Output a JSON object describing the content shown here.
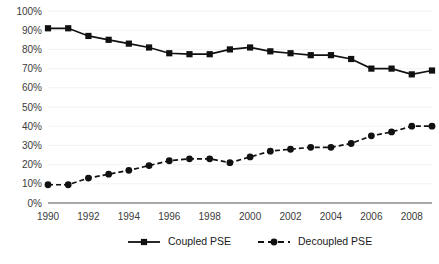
{
  "chart_data": {
    "type": "line",
    "title": "",
    "subtitle": "",
    "xlabel": "",
    "ylabel": "",
    "x": [
      1990,
      1991,
      1992,
      1993,
      1994,
      1995,
      1996,
      1997,
      1998,
      1999,
      2000,
      2001,
      2002,
      2003,
      2004,
      2005,
      2006,
      2007,
      2008,
      2009
    ],
    "categories": [
      "1990",
      "1991",
      "1992",
      "1993",
      "1994",
      "1995",
      "1996",
      "1997",
      "1998",
      "1999",
      "2000",
      "2001",
      "2002",
      "2003",
      "2004",
      "2005",
      "2006",
      "2007",
      "2008",
      "2009"
    ],
    "xlim": [
      1990,
      2009
    ],
    "ylim": [
      0,
      100
    ],
    "ytick_values": [
      0,
      10,
      20,
      30,
      40,
      50,
      60,
      70,
      80,
      90,
      100
    ],
    "ytick_labels": [
      "0%",
      "10%",
      "20%",
      "30%",
      "40%",
      "50%",
      "60%",
      "70%",
      "80%",
      "90%",
      "100%"
    ],
    "xtick_labels": [
      "1990",
      "1992",
      "1994",
      "1996",
      "1998",
      "2000",
      "2002",
      "2004",
      "2006",
      "2008"
    ],
    "grid": true,
    "grid_axis": "y",
    "legend_position": "bottom",
    "series": [
      {
        "name": "Coupled PSE",
        "marker": "square",
        "linestyle": "solid",
        "color": "#111111",
        "values": [
          91,
          91,
          87,
          85,
          83,
          81,
          78,
          77.5,
          77.5,
          80,
          81,
          79,
          78,
          77,
          77,
          75,
          70,
          70,
          67,
          69
        ]
      },
      {
        "name": "Decoupled PSE",
        "marker": "circle",
        "linestyle": "dotted",
        "color": "#111111",
        "values": [
          9.5,
          9.5,
          13,
          15,
          17,
          19.5,
          22,
          23,
          23,
          21,
          24,
          27,
          28,
          29,
          29,
          31,
          35,
          37,
          40,
          40
        ]
      }
    ]
  },
  "legend": {
    "items": [
      {
        "label": "Coupled PSE",
        "marker": "square",
        "linestyle": "solid"
      },
      {
        "label": "Decoupled PSE",
        "marker": "circle",
        "linestyle": "dotted"
      }
    ]
  }
}
